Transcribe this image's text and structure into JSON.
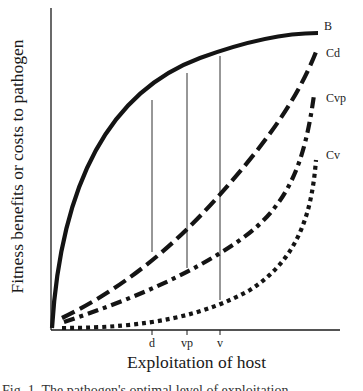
{
  "figure": {
    "y_axis_label": "Fitness benefits or costs to pathogen",
    "x_axis_label": "Exploitation of host",
    "cut_off_caption": "Fig. 1. The pathogen's optimal level of exploitation"
  },
  "chart_data": {
    "type": "line",
    "title": "",
    "xlabel": "Exploitation of host",
    "ylabel": "Fitness benefits or costs to pathogen",
    "grid": false,
    "x_ticks": [
      {
        "label": "d",
        "x": 152
      },
      {
        "label": "vp",
        "x": 187
      },
      {
        "label": "v",
        "x": 220
      }
    ],
    "series": [
      {
        "name": "B",
        "style": "solid",
        "description": "benefit curve, concave, saturating",
        "path": "M52,328 C60,200 100,95 200,58 C260,36 300,33 318,33",
        "label_x": 324,
        "label_y": 26
      },
      {
        "name": "Cd",
        "style": "dashed",
        "description": "cost curve (direct transmission)",
        "path": "M62,318 C120,290 170,250 215,200 C260,150 295,105 316,52",
        "label_x": 326,
        "label_y": 52
      },
      {
        "name": "Cvp",
        "style": "dash-dot",
        "description": "cost curve (vector/pathogen)",
        "path": "M64,322 C130,300 190,275 240,240 C290,205 305,160 314,95",
        "label_x": 326,
        "label_y": 91
      },
      {
        "name": "Cv",
        "style": "dotted",
        "description": "cost curve (vector-borne)",
        "path": "M62,328 C150,328 205,315 250,290 C300,258 312,210 316,160",
        "label_x": 326,
        "label_y": 148
      }
    ],
    "drop_lines": [
      {
        "label": "d",
        "x": 152,
        "y_top": 100,
        "y_bottom": 252
      },
      {
        "label": "vp",
        "x": 187,
        "y_top": 73,
        "y_bottom": 268
      },
      {
        "label": "v",
        "x": 220,
        "y_top": 56,
        "y_bottom": 300
      }
    ],
    "axes": {
      "origin_x": 51,
      "origin_y": 330,
      "x_end": 340,
      "y_top": 8
    }
  }
}
